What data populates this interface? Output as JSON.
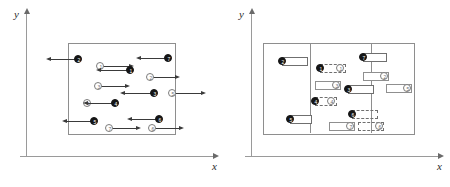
{
  "figure": {
    "panels": [
      {
        "id": "left-panel",
        "name": "velocity-panel",
        "axis": {
          "x_label": "x",
          "y_label": "y"
        },
        "box": {
          "label": "domain-box"
        },
        "particles": [
          {
            "id": "p-open-1",
            "label": "1",
            "type": "open",
            "x": 96,
            "y": 62,
            "vector": "right",
            "len": 26
          },
          {
            "id": "p-filled-1",
            "label": "1",
            "type": "filled",
            "x": 126,
            "y": 66,
            "vector": "left",
            "len": 26
          },
          {
            "id": "p-filled-2",
            "label": "2",
            "type": "filled",
            "x": 74,
            "y": 55,
            "vector": "left",
            "len": 24
          },
          {
            "id": "p-open-2",
            "label": "2",
            "type": "open",
            "x": 146,
            "y": 73,
            "vector": "right",
            "len": 22
          },
          {
            "id": "p-open-3",
            "label": "3",
            "type": "open",
            "x": 94,
            "y": 82,
            "vector": "right",
            "len": 24
          },
          {
            "id": "p-filled-3",
            "label": "3",
            "type": "filled",
            "x": 150,
            "y": 89,
            "vector": "left",
            "len": 26
          },
          {
            "id": "p-open-5",
            "label": "5",
            "type": "open",
            "x": 168,
            "y": 89,
            "vector": "right",
            "len": 26
          },
          {
            "id": "p-open-4",
            "label": "4",
            "type": "open",
            "x": 83,
            "y": 99,
            "vector": "right",
            "len": 24
          },
          {
            "id": "p-filled-4",
            "label": "4",
            "type": "filled",
            "x": 111,
            "y": 99,
            "vector": "left",
            "len": 24
          },
          {
            "id": "p-filled-7",
            "label": "7",
            "type": "filled",
            "x": 164,
            "y": 54,
            "vector": "left",
            "len": 24
          },
          {
            "id": "p-filled-5",
            "label": "5",
            "type": "filled",
            "x": 90,
            "y": 117,
            "vector": "left",
            "len": 24
          },
          {
            "id": "p-open-7",
            "label": "7",
            "type": "open",
            "x": 105,
            "y": 124,
            "vector": "right",
            "len": 24
          },
          {
            "id": "p-filled-6",
            "label": "6",
            "type": "filled",
            "x": 155,
            "y": 115,
            "vector": "left",
            "len": 24
          },
          {
            "id": "p-open-6",
            "label": "6",
            "type": "open",
            "x": 148,
            "y": 124,
            "vector": "right",
            "len": 24
          }
        ]
      },
      {
        "id": "right-panel",
        "name": "displacement-panel",
        "axis": {
          "x_label": "x",
          "y_label": "y"
        },
        "box": {
          "label": "domain-box"
        },
        "inner_box": {
          "label": "inner-region"
        },
        "displacements": [
          {
            "id": "d-filled-2",
            "label": "2",
            "type": "filled",
            "style": "solid",
            "x": 53,
            "y": 57,
            "w": 26
          },
          {
            "id": "d-filled-1",
            "label": "1",
            "type": "filled",
            "style": "dashed",
            "x": 91,
            "y": 64,
            "w": 26,
            "tag": "1",
            "tagpos": "right"
          },
          {
            "id": "d-filled-7",
            "label": "7",
            "type": "filled",
            "style": "solid",
            "x": 134,
            "y": 53,
            "w": 24
          },
          {
            "id": "d-open-2",
            "label": "2",
            "type": "open",
            "style": "hollow",
            "x": 134,
            "y": 72,
            "w": 26,
            "tag": "2",
            "tagpos": "right"
          },
          {
            "id": "d-open-3",
            "label": "3",
            "type": "open",
            "style": "hollow",
            "x": 86,
            "y": 81,
            "w": 26,
            "tag": "3",
            "tagpos": "right"
          },
          {
            "id": "d-filled-3",
            "label": "3",
            "type": "filled",
            "style": "solid",
            "x": 119,
            "y": 85,
            "w": 26
          },
          {
            "id": "d-open-5",
            "label": "5",
            "type": "open",
            "style": "hollow",
            "x": 157,
            "y": 84,
            "w": 26,
            "tag": "5",
            "tagpos": "right"
          },
          {
            "id": "d-filled-4",
            "label": "4",
            "type": "filled",
            "style": "dashed",
            "x": 86,
            "y": 97,
            "w": 22,
            "tag": "4",
            "tagpos": "right"
          },
          {
            "id": "d-filled-5",
            "label": "5",
            "type": "filled",
            "style": "solid",
            "x": 61,
            "y": 115,
            "w": 22
          },
          {
            "id": "d-filled-6",
            "label": "6",
            "type": "filled",
            "style": "dashed",
            "x": 123,
            "y": 110,
            "w": 26
          },
          {
            "id": "d-open-7",
            "label": "7",
            "type": "open",
            "style": "hollow",
            "x": 100,
            "y": 122,
            "w": 26,
            "tag": "7",
            "tagpos": "right"
          },
          {
            "id": "d-open-6",
            "label": "6",
            "type": "open",
            "style": "dashed",
            "x": 129,
            "y": 122,
            "w": 26,
            "tag": "6",
            "tagpos": "right"
          }
        ]
      }
    ]
  }
}
